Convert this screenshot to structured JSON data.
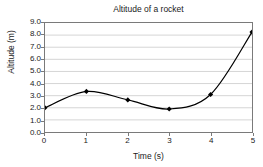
{
  "chart_data": {
    "type": "line",
    "title": "Altitude of a rocket",
    "xlabel": "Time (s)",
    "ylabel": "Altitude (m)",
    "x": [
      0,
      1,
      2,
      3,
      4,
      5
    ],
    "values": [
      2.0,
      3.35,
      2.65,
      1.9,
      3.1,
      8.25
    ],
    "series": [
      {
        "name": "Altitude",
        "values": [
          2.0,
          3.35,
          2.65,
          1.9,
          3.1,
          8.25
        ]
      }
    ],
    "xlim": [
      0,
      5
    ],
    "ylim": [
      0,
      9
    ],
    "x_tick_labels": [
      "0",
      "1",
      "2",
      "3",
      "4",
      "5"
    ],
    "y_tick_labels": [
      "0.0",
      "1.0",
      "2.0",
      "3.0",
      "4.0",
      "5.0",
      "6.0",
      "7.0",
      "8.0",
      "9.0"
    ],
    "y_ticks": [
      0,
      1,
      2,
      3,
      4,
      5,
      6,
      7,
      8,
      9
    ],
    "grid": "horizontal",
    "legend": "none",
    "marker": "diamond",
    "line_color": "#000000",
    "marker_color": "#000000",
    "grid_color": "#d4d4d4",
    "axis_color": "#7a7a7a",
    "background_color": "#ffffff",
    "smoothing": "spline"
  }
}
